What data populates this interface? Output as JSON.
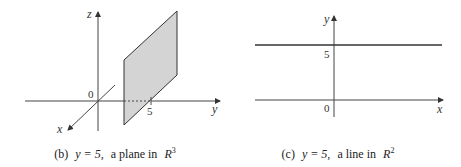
{
  "panels": [
    {
      "id": "b",
      "caption": {
        "prefix": "(b)",
        "equation": "y = 5,",
        "text": "a plane in",
        "space": "R",
        "exponent": "3"
      },
      "axes": {
        "x": "x",
        "y": "y",
        "z": "z"
      },
      "origin_label": "0",
      "tick_label": "5",
      "plane_fill": "#d4d4d4"
    },
    {
      "id": "c",
      "caption": {
        "prefix": "(c)",
        "equation": "y = 5,",
        "text": "a line in",
        "space": "R",
        "exponent": "2"
      },
      "axes": {
        "x": "x",
        "y": "y"
      },
      "origin_label": "0",
      "tick_label": "5"
    }
  ]
}
